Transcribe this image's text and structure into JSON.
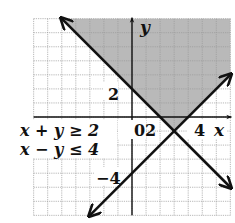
{
  "chart_data": {
    "type": "line",
    "title": "",
    "subtitle": "",
    "xlabel": "x",
    "ylabel": "y",
    "xlim": [
      -7,
      7
    ],
    "ylim": [
      -7,
      7
    ],
    "grid": true,
    "grid_step": 1,
    "tick_labels": {
      "x": [
        {
          "value": 0,
          "label": "0"
        },
        {
          "value": 2,
          "label": "2"
        },
        {
          "value": 4,
          "label": "4"
        }
      ],
      "y": [
        {
          "value": 2,
          "label": "2"
        },
        {
          "value": -4,
          "label": "-4"
        }
      ]
    },
    "series": [
      {
        "name": "x + y = 2",
        "inequality": "x + y ≥ 2",
        "points": [
          [
            -5,
            7
          ],
          [
            7,
            -5
          ]
        ],
        "arrows": "both"
      },
      {
        "name": "x - y = 4",
        "inequality": "x - y ≤ 4",
        "points": [
          [
            -3,
            -7
          ],
          [
            7,
            3
          ]
        ],
        "arrows": "both"
      }
    ],
    "shaded_region": {
      "description": "Solution set of x + y ≥ 2 and x − y ≤ 4",
      "vertex": [
        3,
        -1
      ],
      "polygon": [
        [
          -5,
          7
        ],
        [
          7,
          7
        ],
        [
          7,
          3
        ],
        [
          3,
          -1
        ]
      ],
      "color": "#b9b9b9"
    },
    "annotations": [
      {
        "text": "x + y ≥ 2",
        "position": "left of origin, row 1"
      },
      {
        "text": "x − y ≤ 4",
        "position": "left of origin, row 2"
      }
    ],
    "legend": null
  },
  "labels": {
    "x_axis": "x",
    "y_axis": "y",
    "tick_y_2": "2",
    "tick_y_neg4": "−4",
    "tick_origin": "0",
    "tick_x_2": "2",
    "tick_x_4": "4",
    "ineq1": "x + y ≥ 2",
    "ineq2": "x − y ≤ 4"
  },
  "colors": {
    "shade": "#b9b9b9",
    "grid": "#9a9a9a",
    "axis": "#111111",
    "line": "#111111"
  }
}
